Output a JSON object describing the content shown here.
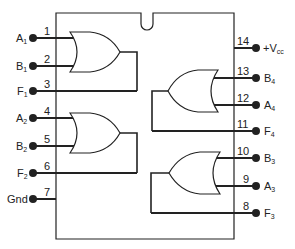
{
  "diagram": {
    "type": "IC pinout",
    "colors": {
      "line": "#222222",
      "background": "#ffffff"
    },
    "left_pins": [
      {
        "number": "1",
        "name": "A",
        "sub": "1",
        "y": 38
      },
      {
        "number": "2",
        "name": "B",
        "sub": "1",
        "y": 66
      },
      {
        "number": "3",
        "name": "F",
        "sub": "1",
        "y": 91
      },
      {
        "number": "4",
        "name": "A",
        "sub": "2",
        "y": 118
      },
      {
        "number": "5",
        "name": "B",
        "sub": "2",
        "y": 146
      },
      {
        "number": "6",
        "name": "F",
        "sub": "2",
        "y": 173
      },
      {
        "number": "7",
        "name": "Gnd",
        "sub": "",
        "y": 199
      }
    ],
    "right_pins": [
      {
        "number": "14",
        "name": "+V",
        "sub": "cc",
        "y": 48
      },
      {
        "number": "13",
        "name": "B",
        "sub": "4",
        "y": 78
      },
      {
        "number": "12",
        "name": "A",
        "sub": "4",
        "y": 105
      },
      {
        "number": "11",
        "name": "F",
        "sub": "4",
        "y": 131
      },
      {
        "number": "10",
        "name": "B",
        "sub": "3",
        "y": 158
      },
      {
        "number": "9",
        "name": "A",
        "sub": "3",
        "y": 186
      },
      {
        "number": "8",
        "name": "F",
        "sub": "3",
        "y": 213
      }
    ],
    "gates": [
      {
        "id": "gate-1",
        "type": "OR",
        "inputs": [
          "A1",
          "B1"
        ],
        "output": "F1"
      },
      {
        "id": "gate-2",
        "type": "OR",
        "inputs": [
          "A2",
          "B2"
        ],
        "output": "F2"
      },
      {
        "id": "gate-3",
        "type": "OR",
        "inputs": [
          "A3",
          "B3"
        ],
        "output": "F3"
      },
      {
        "id": "gate-4",
        "type": "OR",
        "inputs": [
          "A4",
          "B4"
        ],
        "output": "F4"
      }
    ]
  }
}
